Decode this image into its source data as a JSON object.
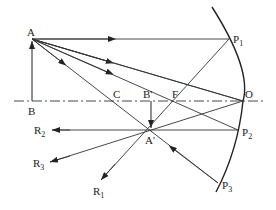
{
  "diagram": {
    "type": "concave-mirror-ray-diagram",
    "labels": {
      "A": "A",
      "B": "B",
      "C": "C",
      "B_prime": "B'",
      "F": "F",
      "O": "O",
      "A_prime": "A'",
      "P1": "P",
      "P1_sub": "1",
      "P2": "P",
      "P2_sub": "2",
      "P3": "P",
      "P3_sub": "3",
      "R1": "R",
      "R1_sub": "1",
      "R2": "R",
      "R2_sub": "2",
      "R3": "R",
      "R3_sub": "3"
    },
    "points": {
      "A": [
        32,
        39
      ],
      "B": [
        32,
        101
      ],
      "C": [
        117,
        101
      ],
      "B_prime": [
        151,
        101
      ],
      "F": [
        176,
        101
      ],
      "O": [
        243,
        101
      ],
      "A_prime": [
        151,
        130
      ],
      "P1": [
        229,
        39
      ],
      "P2": [
        238,
        130
      ],
      "P3": [
        218,
        183
      ],
      "R1": [
        101,
        184
      ],
      "R2": [
        50,
        130
      ],
      "R3": [
        48,
        163
      ]
    },
    "colors": {
      "line": "#333333",
      "background": "#ffffff"
    }
  }
}
